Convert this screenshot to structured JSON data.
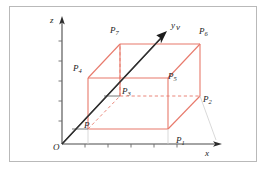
{
  "figure": {
    "kind": "3d-coordinate-diagram",
    "frame_color": "#b9b9b9",
    "background_color": "#ffffff",
    "axis_color": "#4a4a4a",
    "box_color": "#e8796b",
    "vector_color": "#3a3a3a",
    "dashed_box_color": "#e8796b"
  },
  "axes": {
    "origin_label": "O",
    "x_label": "x",
    "y_label": "y",
    "z_label": "z",
    "x_ticks": 5,
    "z_ticks": 5
  },
  "vector": {
    "label": "v"
  },
  "points": [
    {
      "id": "P",
      "base": "P",
      "sub": "",
      "x": 84,
      "y": 121
    },
    {
      "id": "P1",
      "base": "P",
      "sub": "1",
      "x": 176,
      "y": 136
    },
    {
      "id": "P2",
      "base": "P",
      "sub": "2",
      "x": 203,
      "y": 95
    },
    {
      "id": "P3",
      "base": "P",
      "sub": "3",
      "x": 122,
      "y": 87
    },
    {
      "id": "P4",
      "base": "P",
      "sub": "4",
      "x": 73,
      "y": 64
    },
    {
      "id": "P5",
      "base": "P",
      "sub": "5",
      "x": 168,
      "y": 72
    },
    {
      "id": "P6",
      "base": "P",
      "sub": "6",
      "x": 199,
      "y": 27
    },
    {
      "id": "P7",
      "base": "P",
      "sub": "7",
      "x": 110,
      "y": 26
    }
  ]
}
